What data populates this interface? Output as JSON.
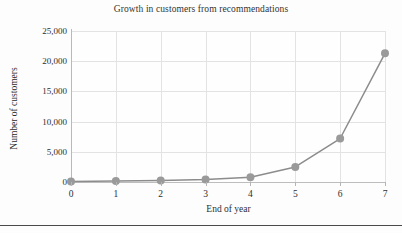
{
  "chart_data": {
    "type": "line",
    "title": "Growth in customers from recommendations",
    "xlabel": "End of year",
    "ylabel": "Number of customers",
    "x": [
      0,
      1,
      2,
      3,
      4,
      5,
      6,
      7
    ],
    "values": [
      100,
      150,
      250,
      400,
      800,
      2500,
      7200,
      21300
    ],
    "categories": [
      "0",
      "1",
      "2",
      "3",
      "4",
      "5",
      "6",
      "7"
    ],
    "xticklabels": [
      "0",
      "1",
      "2",
      "3",
      "4",
      "5",
      "6",
      "7"
    ],
    "yticklabels": [
      "0",
      "5,000",
      "10,000",
      "15,000",
      "20,000",
      "25,000"
    ],
    "yticks": [
      0,
      5000,
      10000,
      15000,
      20000,
      25000
    ],
    "xlim": [
      0,
      7
    ],
    "ylim": [
      0,
      25000
    ],
    "grid": true,
    "legend": false,
    "legend_position": "none",
    "series": [
      {
        "name": "Number of customers",
        "values": [
          100,
          150,
          250,
          400,
          800,
          2500,
          7200,
          21300
        ]
      }
    ],
    "colors": {
      "line": "#8c8c8c",
      "marker": "#9a9a9a",
      "grid": "#e3e3e3",
      "axis": "#bdbdbd",
      "text": "#2e2e2e",
      "background": "#fdfdfd",
      "rule": "#4a4a4a"
    },
    "marker_style": "circle",
    "marker_size": 4
  }
}
